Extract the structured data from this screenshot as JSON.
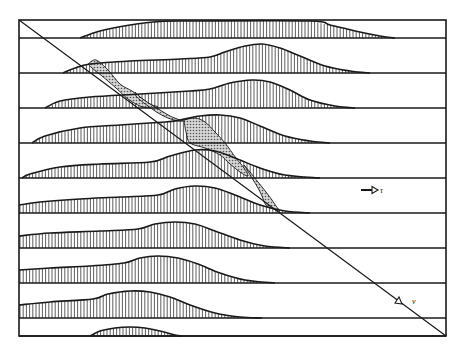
{
  "figure": {
    "width": 465,
    "height": 354,
    "background": "#ffffff",
    "ink": "#1a1a1a",
    "stipple_color": "#bdbdbd",
    "frame": {
      "x1": 19,
      "y1": 20,
      "x2": 446,
      "y2": 336
    },
    "diagonal": {
      "x1": 19,
      "y1": 20,
      "x2": 446,
      "y2": 336
    },
    "hatch_spacing": 3.2,
    "bands": [
      {
        "baseline": 38,
        "profile": [
          [
            80,
            38
          ],
          [
            100,
            31
          ],
          [
            130,
            25
          ],
          [
            160,
            21.5
          ],
          [
            200,
            21
          ],
          [
            310,
            21
          ],
          [
            330,
            25
          ],
          [
            355,
            31
          ],
          [
            380,
            36
          ],
          [
            395,
            38
          ]
        ]
      },
      {
        "baseline": 73,
        "profile": [
          [
            63,
            73
          ],
          [
            75,
            68
          ],
          [
            90,
            64
          ],
          [
            130,
            61
          ],
          [
            180,
            59
          ],
          [
            210,
            57
          ],
          [
            225,
            52
          ],
          [
            245,
            46
          ],
          [
            262,
            44
          ],
          [
            280,
            48
          ],
          [
            300,
            56
          ],
          [
            325,
            66
          ],
          [
            350,
            71
          ],
          [
            370,
            73
          ]
        ]
      },
      {
        "baseline": 108,
        "profile": [
          [
            45,
            108
          ],
          [
            60,
            101
          ],
          [
            90,
            97
          ],
          [
            140,
            94
          ],
          [
            190,
            91
          ],
          [
            210,
            89
          ],
          [
            230,
            83
          ],
          [
            252,
            80
          ],
          [
            270,
            82
          ],
          [
            290,
            90
          ],
          [
            310,
            100
          ],
          [
            335,
            106
          ],
          [
            355,
            108
          ]
        ]
      },
      {
        "baseline": 143,
        "profile": [
          [
            32,
            143
          ],
          [
            45,
            136
          ],
          [
            80,
            128
          ],
          [
            120,
            125
          ],
          [
            165,
            122
          ],
          [
            180,
            120
          ],
          [
            200,
            116
          ],
          [
            220,
            115
          ],
          [
            240,
            118
          ],
          [
            260,
            126
          ],
          [
            285,
            136
          ],
          [
            310,
            141
          ],
          [
            330,
            143
          ]
        ]
      },
      {
        "baseline": 178,
        "profile": [
          [
            22,
            178
          ],
          [
            30,
            174
          ],
          [
            60,
            167
          ],
          [
            100,
            164
          ],
          [
            150,
            162
          ],
          [
            170,
            156
          ],
          [
            195,
            150
          ],
          [
            215,
            151
          ],
          [
            235,
            158
          ],
          [
            260,
            168
          ],
          [
            285,
            175
          ],
          [
            320,
            178
          ]
        ]
      },
      {
        "baseline": 213,
        "profile": [
          [
            19,
            205
          ],
          [
            40,
            202
          ],
          [
            80,
            199
          ],
          [
            120,
            197
          ],
          [
            158,
            195
          ],
          [
            175,
            189
          ],
          [
            195,
            186
          ],
          [
            215,
            188
          ],
          [
            235,
            195
          ],
          [
            260,
            205
          ],
          [
            285,
            211
          ],
          [
            310,
            213
          ]
        ]
      },
      {
        "baseline": 248,
        "profile": [
          [
            19,
            236
          ],
          [
            50,
            233
          ],
          [
            100,
            231
          ],
          [
            138,
            229
          ],
          [
            155,
            224
          ],
          [
            175,
            222
          ],
          [
            195,
            224
          ],
          [
            215,
            231
          ],
          [
            240,
            240
          ],
          [
            265,
            246
          ],
          [
            290,
            248
          ]
        ]
      },
      {
        "baseline": 283,
        "profile": [
          [
            19,
            270
          ],
          [
            50,
            268
          ],
          [
            90,
            266
          ],
          [
            124,
            263
          ],
          [
            140,
            258
          ],
          [
            158,
            256
          ],
          [
            178,
            258
          ],
          [
            198,
            264
          ],
          [
            220,
            273
          ],
          [
            245,
            280
          ],
          [
            275,
            283
          ]
        ]
      },
      {
        "baseline": 318,
        "profile": [
          [
            19,
            305
          ],
          [
            50,
            302
          ],
          [
            93,
            299
          ],
          [
            108,
            294
          ],
          [
            130,
            291
          ],
          [
            150,
            292
          ],
          [
            170,
            297
          ],
          [
            190,
            305
          ],
          [
            215,
            313
          ],
          [
            240,
            317
          ],
          [
            262,
            318
          ]
        ]
      },
      {
        "baseline": 336,
        "profile": [
          [
            90,
            336
          ],
          [
            100,
            331
          ],
          [
            115,
            328
          ],
          [
            130,
            327
          ],
          [
            145,
            328
          ],
          [
            160,
            331
          ],
          [
            175,
            335
          ],
          [
            182,
            336
          ]
        ]
      }
    ],
    "stippled_regions": [
      [
        [
          88,
          64
        ],
        [
          96,
          60
        ],
        [
          108,
          70
        ],
        [
          120,
          84
        ],
        [
          132,
          91
        ],
        [
          140,
          97
        ],
        [
          150,
          104
        ],
        [
          158,
          107
        ],
        [
          150,
          108
        ],
        [
          140,
          106
        ],
        [
          128,
          99
        ],
        [
          116,
          88
        ],
        [
          102,
          76
        ],
        [
          92,
          68
        ]
      ],
      [
        [
          135,
          92
        ],
        [
          140,
          97
        ],
        [
          150,
          104
        ],
        [
          160,
          110
        ],
        [
          170,
          116
        ],
        [
          180,
          120
        ],
        [
          183,
          121
        ],
        [
          178,
          121
        ],
        [
          168,
          118
        ],
        [
          158,
          113
        ],
        [
          148,
          106
        ],
        [
          140,
          100
        ],
        [
          136,
          96
        ]
      ],
      [
        [
          184,
          120
        ],
        [
          195,
          118
        ],
        [
          205,
          122
        ],
        [
          215,
          132
        ],
        [
          225,
          143
        ],
        [
          236,
          158
        ],
        [
          244,
          168
        ],
        [
          248,
          176
        ],
        [
          240,
          172
        ],
        [
          230,
          164
        ],
        [
          220,
          155
        ],
        [
          205,
          148
        ],
        [
          190,
          143
        ],
        [
          186,
          132
        ]
      ],
      [
        [
          244,
          165
        ],
        [
          250,
          172
        ],
        [
          258,
          182
        ],
        [
          266,
          192
        ],
        [
          272,
          200
        ],
        [
          276,
          206
        ],
        [
          280,
          211
        ],
        [
          276,
          210
        ],
        [
          266,
          205
        ],
        [
          262,
          196
        ],
        [
          258,
          188
        ],
        [
          252,
          178
        ]
      ]
    ],
    "annotations": [
      {
        "id": "tau",
        "text": "τ",
        "x": 380,
        "y": 193
      },
      {
        "id": "nu",
        "text": "ν",
        "x": 412,
        "y": 304
      }
    ],
    "tau_arrow": {
      "x1": 361,
      "y1": 190,
      "x2": 378,
      "y2": 190
    },
    "nu_arrow": {
      "tip_x": 402,
      "tip_y": 304
    }
  }
}
